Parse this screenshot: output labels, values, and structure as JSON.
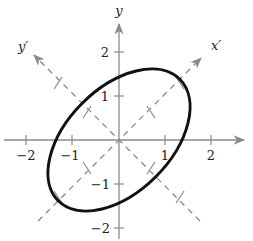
{
  "diagram": {
    "type": "rotated-ellipse-with-axes",
    "colors": {
      "background": "#ffffff",
      "axis": "#8a8a8a",
      "rotated_axis": "#8a8a8a",
      "ellipse": "#111111",
      "text": "#222222"
    },
    "axes": {
      "x_label": "",
      "y_label": "y",
      "x_prime_label": "x′",
      "y_prime_label": "y′",
      "x_ticks": [
        {
          "value": -2,
          "label": "−2"
        },
        {
          "value": -1,
          "label": "−1"
        },
        {
          "value": 1,
          "label": "1"
        },
        {
          "value": 2,
          "label": "2"
        }
      ],
      "y_ticks": [
        {
          "value": 2,
          "label": "2"
        },
        {
          "value": 1,
          "label": "1"
        },
        {
          "value": -1,
          "label": "−1"
        },
        {
          "value": -2,
          "label": "−2"
        }
      ],
      "rotation_degrees": 45
    },
    "ellipse": {
      "center": [
        0,
        0
      ],
      "semi_major_along_x_prime": 1.9,
      "semi_minor_along_y_prime": 1.15,
      "rotation_degrees": 45
    }
  }
}
